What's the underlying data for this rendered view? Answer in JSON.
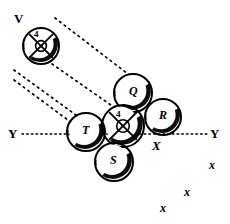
{
  "figure": {
    "title": "",
    "background_color": "#ffffff",
    "ink_color": "#000000",
    "width": 230,
    "height": 224
  },
  "disks": [
    {
      "id": "disk-v",
      "label": "V",
      "label_position": "outside-top-left",
      "inner_label": "4",
      "has_cross": true,
      "cx": 41,
      "cy": 46,
      "r": 18
    },
    {
      "id": "disk-q",
      "label": "Q",
      "label_position": "inside",
      "inner_label": "",
      "has_cross": false,
      "cx": 133,
      "cy": 93,
      "r": 19
    },
    {
      "id": "disk-r",
      "label": "R",
      "label_position": "inside",
      "inner_label": "",
      "has_cross": false,
      "cx": 163,
      "cy": 117,
      "r": 18
    },
    {
      "id": "disk-center",
      "label": "",
      "label_position": "inside",
      "inner_label": "4",
      "has_cross": true,
      "cx": 123,
      "cy": 126,
      "r": 21
    },
    {
      "id": "disk-t",
      "label": "T",
      "label_position": "inside",
      "inner_label": "",
      "has_cross": false,
      "cx": 86,
      "cy": 132,
      "r": 19
    },
    {
      "id": "disk-s",
      "label": "S",
      "label_position": "inside",
      "inner_label": "",
      "has_cross": false,
      "cx": 114,
      "cy": 162,
      "r": 19
    }
  ],
  "axis": {
    "left_label": "Y",
    "right_label": "Y",
    "x_label": "X",
    "y_position": 134,
    "left_x": 22,
    "right_x": 208
  },
  "dotted_lines": [
    {
      "id": "line-1",
      "x1": 55,
      "y1": 18,
      "x2": 128,
      "y2": 74
    },
    {
      "id": "line-2",
      "x1": 52,
      "y1": 64,
      "x2": 118,
      "y2": 110
    },
    {
      "id": "line-3",
      "x1": 14,
      "y1": 70,
      "x2": 80,
      "y2": 118
    },
    {
      "id": "line-4",
      "x1": 14,
      "y1": 80,
      "x2": 76,
      "y2": 126
    }
  ],
  "marks": [
    {
      "id": "mark-x-1",
      "label": "x",
      "x": 209,
      "y": 159
    },
    {
      "id": "mark-x-2",
      "label": "x",
      "x": 184,
      "y": 186
    },
    {
      "id": "mark-x-3",
      "label": "x",
      "x": 160,
      "y": 202
    }
  ],
  "colors": {
    "ink": "#000000",
    "paper": "#ffffff"
  }
}
